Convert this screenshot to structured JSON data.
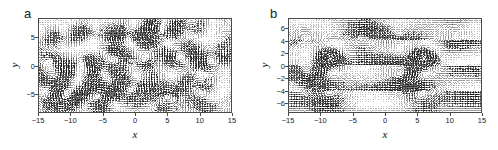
{
  "figure": {
    "background": "#ffffff",
    "arrow_color": "#000000",
    "frame_color": "#4a4a4a"
  },
  "panels": [
    {
      "id": "a",
      "label": "a",
      "axis": {
        "xlabel": "x",
        "ylabel": "y",
        "xticks": [
          "-15",
          "-10",
          "-5",
          "0",
          "5",
          "10",
          "15"
        ],
        "xtick_values": [
          -15,
          -10,
          -5,
          0,
          5,
          10,
          15
        ],
        "yticks": [
          "5",
          "0",
          "-5"
        ],
        "ytick_values": [
          5,
          0,
          -5
        ],
        "xlim": [
          -15,
          15
        ],
        "ylim": [
          -8.2,
          8.2
        ],
        "grid": false
      }
    },
    {
      "id": "b",
      "label": "b",
      "axis": {
        "xlabel": "x",
        "ylabel": "y",
        "xticks": [
          "-15",
          "-10",
          "-5",
          "0",
          "5",
          "10",
          "15"
        ],
        "xtick_values": [
          -15,
          -10,
          -5,
          0,
          5,
          10,
          15
        ],
        "yticks": [
          "6",
          "4",
          "2",
          "0",
          "-2",
          "-4",
          "-6"
        ],
        "ytick_values": [
          6,
          4,
          2,
          0,
          -2,
          -4,
          -6
        ],
        "xlim": [
          -15,
          15
        ],
        "ylim": [
          -7.6,
          7.6
        ],
        "grid": false
      }
    }
  ],
  "chart_data": [
    {
      "type": "quiver",
      "panel": "a",
      "title": "",
      "xlabel": "x",
      "ylabel": "y",
      "xlim": [
        -15,
        15
      ],
      "ylim": [
        -8.2,
        8.2
      ],
      "grid": false,
      "legend": null,
      "description": "Disordered vector field: many small-scale swirls and shear bands of varying orientation filling the domain, no dominant coherent vortex pair.",
      "field_model": "disordered",
      "nx": 74,
      "ny": 40,
      "vortices": [
        {
          "x": -11.5,
          "y": 5.5,
          "strength": 1.0,
          "radius": 2.6
        },
        {
          "x": -6.5,
          "y": 6.2,
          "strength": -0.9,
          "radius": 2.3
        },
        {
          "x": -1.2,
          "y": 5.0,
          "strength": 1.1,
          "radius": 2.7
        },
        {
          "x": 4.5,
          "y": 6.0,
          "strength": -1.0,
          "radius": 2.4
        },
        {
          "x": 9.5,
          "y": 5.2,
          "strength": 0.9,
          "radius": 2.5
        },
        {
          "x": -13.0,
          "y": 1.0,
          "strength": -1.1,
          "radius": 2.6
        },
        {
          "x": -8.0,
          "y": 0.5,
          "strength": 1.0,
          "radius": 2.8
        },
        {
          "x": -3.0,
          "y": 1.5,
          "strength": -1.0,
          "radius": 2.5
        },
        {
          "x": 1.5,
          "y": 0.8,
          "strength": 1.2,
          "radius": 2.9
        },
        {
          "x": 6.5,
          "y": 1.2,
          "strength": -1.0,
          "radius": 2.6
        },
        {
          "x": 11.5,
          "y": 0.6,
          "strength": 1.0,
          "radius": 2.5
        },
        {
          "x": -11.0,
          "y": -4.5,
          "strength": 1.0,
          "radius": 2.6
        },
        {
          "x": -5.5,
          "y": -5.5,
          "strength": -1.0,
          "radius": 2.4
        },
        {
          "x": -0.5,
          "y": -4.2,
          "strength": 1.0,
          "radius": 2.7
        },
        {
          "x": 5.0,
          "y": -5.5,
          "strength": -1.1,
          "radius": 2.5
        },
        {
          "x": 10.5,
          "y": -4.5,
          "strength": 1.0,
          "radius": 2.6
        }
      ]
    },
    {
      "type": "quiver",
      "panel": "b",
      "title": "",
      "xlabel": "x",
      "ylabel": "y",
      "xlim": [
        -15,
        15
      ],
      "ylim": [
        -7.6,
        7.6
      ],
      "grid": false,
      "legend": null,
      "description": "Organised vector field: two strong dark concentrated vortex cores near (-8.5, 1) and (6, 1), surrounded by long horizontal shear streaks and a periodic pattern repeating along x.",
      "field_model": "ordered",
      "nx": 74,
      "ny": 40,
      "vortices": [
        {
          "x": -8.5,
          "y": 1.0,
          "strength": 3.2,
          "radius": 1.5
        },
        {
          "x": 6.0,
          "y": 1.0,
          "strength": 3.2,
          "radius": 1.5
        },
        {
          "x": -12.5,
          "y": 4.5,
          "strength": -0.8,
          "radius": 2.6
        },
        {
          "x": 2.0,
          "y": 4.5,
          "strength": -0.8,
          "radius": 2.6
        },
        {
          "x": -12.0,
          "y": -1.5,
          "strength": -1.0,
          "radius": 2.4
        },
        {
          "x": 2.5,
          "y": -1.5,
          "strength": -1.0,
          "radius": 2.4
        },
        {
          "x": -9.0,
          "y": -4.8,
          "strength": 0.9,
          "radius": 2.6
        },
        {
          "x": 5.5,
          "y": -4.8,
          "strength": 0.9,
          "radius": 2.6
        },
        {
          "x": -3.5,
          "y": 5.0,
          "strength": 0.7,
          "radius": 2.2
        },
        {
          "x": 11.0,
          "y": 5.0,
          "strength": 0.7,
          "radius": 2.2
        }
      ]
    }
  ]
}
